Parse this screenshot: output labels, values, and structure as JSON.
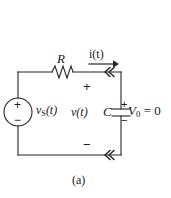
{
  "figure": {
    "caption": "(a)",
    "type": "circuit-schematic"
  },
  "components": {
    "resistor": {
      "label": "R",
      "type": "resistor"
    },
    "capacitor": {
      "label": "C",
      "type": "capacitor"
    },
    "source": {
      "label": "v",
      "label_sub": "S",
      "label_arg": "(t)",
      "type": "voltage-source"
    }
  },
  "quantities": {
    "current": {
      "label": "i(t)",
      "direction": "right"
    },
    "capacitor_voltage": {
      "label": "v(t)"
    },
    "initial_condition": {
      "label": "V",
      "label_sub": "0",
      "label_value": " = 0"
    }
  },
  "polarity": {
    "loop_top_plus": "+",
    "loop_bottom_minus": "−",
    "source_plus": "+",
    "source_minus": "−",
    "capacitor_plus": "+",
    "capacitor_minus": "−"
  },
  "style": {
    "wire_color": "#262626",
    "text_color": "#1a1a1a",
    "background": "#ffffff"
  }
}
